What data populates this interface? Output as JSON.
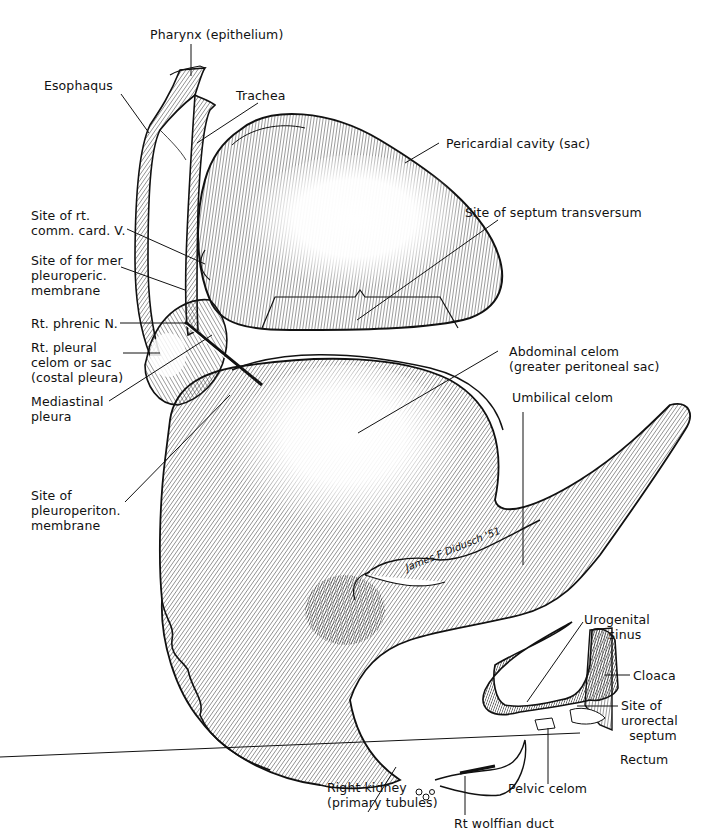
{
  "figure": {
    "colors": {
      "ink": "#111111",
      "paper": "#ffffff",
      "hatch": "#333333"
    }
  },
  "labels": {
    "pharynx": "Pharynx (epithelium)",
    "esophagus": "Esophaqus",
    "trachea": "Trachea",
    "pericardial_cavity": "Pericardial cavity (sac)",
    "septum_transversum": "Site of septum transversum",
    "rt_comm_card_v": "Site of rt.\ncomm. card. V.",
    "pleuroperic_membrane": "Site of for mer\npleuroperic.\nmembrane",
    "rt_phrenic_n": "Rt. phrenic N.",
    "rt_pleural_celom": "Rt. pleural\ncelom or sac\n(costal pleura)",
    "mediastinal_pleura": "Mediastinal\npleura",
    "abdominal_celom": "Abdominal celom\n(greater peritoneal sac)",
    "umbilical_celom": "Umbilical celom",
    "pleuroperiton_membrane": "Site of\npleuroperiton.\nmembrane",
    "urogenital_sinus": "Urogenital\n      sinus",
    "cloaca": "Cloaca",
    "urorectal_septum": "Site of\nurorectal\n  septum",
    "rectum": "Rectum",
    "pelvic_celom": "Pelvic celom",
    "right_kidney": "Right kidney\n(primary tubules)",
    "rt_wolffian_duct": "Rt wolffian duct"
  },
  "signature": "James F Didusch '51"
}
